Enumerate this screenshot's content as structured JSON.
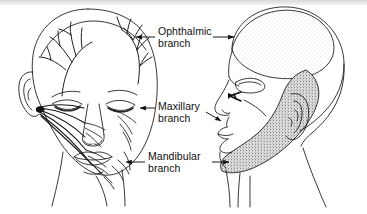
{
  "figure": {
    "background_color": "#ffffff",
    "ink_color": "#101010",
    "views": {
      "left": {
        "name": "anterior-face-nerve-view",
        "description": "Frontal view of face with trigeminal nerve branches drawn radiating over forehead, cheek and jaw"
      },
      "right": {
        "name": "lateral-head-dermatome-view",
        "description": "Lateral profile of head with shaded sensory territories of the three trigeminal divisions"
      }
    },
    "zones": [
      {
        "name": "ophthalmic-zone",
        "label": "Ophthalmic branch",
        "shading": "light-stipple",
        "color": "#f2f2f2"
      },
      {
        "name": "maxillary-zone",
        "label": "Maxillary branch",
        "shading": "none",
        "color": "#ffffff"
      },
      {
        "name": "mandibular-zone",
        "label": "Mandibular branch",
        "shading": "dark-stipple",
        "color": "#9a9a9a"
      }
    ]
  },
  "labels": {
    "ophthalmic": {
      "line1": "Ophthalmic",
      "line2": "branch"
    },
    "maxillary": {
      "line1": "Maxillary",
      "line2": "branch"
    },
    "mandibular": {
      "line1": "Mandibular",
      "line2": "branch"
    }
  },
  "callouts": [
    {
      "name": "ophthalmic-callout",
      "points_left_to": "forehead-nerve-branches",
      "points_right_to": "ophthalmic-zone"
    },
    {
      "name": "maxillary-callout",
      "points_left_to": "cheek-nerve-branches",
      "points_right_to": "nose-upper-lip"
    },
    {
      "name": "mandibular-callout",
      "points_left_to": "jaw-nerve-branches",
      "points_right_to": "mandibular-zone"
    }
  ]
}
